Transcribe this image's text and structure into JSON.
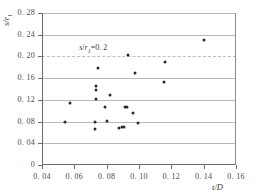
{
  "chart_data": {
    "type": "scatter",
    "title": "",
    "xlabel": "t/D",
    "ylabel": "s/r1",
    "xlim": [
      0.04,
      0.16
    ],
    "ylim": [
      0,
      0.28
    ],
    "xticks": [
      "0. 04",
      "0. 06",
      "0. 08",
      "0. 10",
      "0. 12",
      "0. 14",
      "0. 16"
    ],
    "xtick_values": [
      0.04,
      0.06,
      0.08,
      0.1,
      0.12,
      0.14,
      0.16
    ],
    "yticks": [
      "0",
      "0. 04",
      "0. 08",
      "0. 12",
      "0. 16",
      "0. 20",
      "0. 24",
      "0. 28"
    ],
    "ytick_values": [
      0,
      0.04,
      0.08,
      0.12,
      0.16,
      0.2,
      0.24,
      0.28
    ],
    "grid": true,
    "grid_axis": "y",
    "legend": "none",
    "annotations": [
      {
        "text_prefix": "s",
        "text_sep": "/",
        "text_var": "r",
        "text_sub": "1",
        "text_suffix": "=0. 2",
        "x": 0.063,
        "y": 0.216
      }
    ],
    "reference_line": {
      "y": 0.2,
      "style": "dashed",
      "label": "s/r1=0.2"
    },
    "marker": "filled-circle",
    "marker_color": "#2a2a2a",
    "points": [
      {
        "x": 0.0545,
        "y": 0.0795
      },
      {
        "x": 0.0572,
        "y": 0.1135
      },
      {
        "x": 0.0728,
        "y": 0.0655
      },
      {
        "x": 0.073,
        "y": 0.0795
      },
      {
        "x": 0.0732,
        "y": 0.1215
      },
      {
        "x": 0.0733,
        "y": 0.139
      },
      {
        "x": 0.0733,
        "y": 0.145
      },
      {
        "x": 0.0745,
        "y": 0.179
      },
      {
        "x": 0.0788,
        "y": 0.107
      },
      {
        "x": 0.08,
        "y": 0.0805
      },
      {
        "x": 0.0822,
        "y": 0.129
      },
      {
        "x": 0.0875,
        "y": 0.069
      },
      {
        "x": 0.0893,
        "y": 0.07
      },
      {
        "x": 0.0905,
        "y": 0.0705
      },
      {
        "x": 0.0915,
        "y": 0.106
      },
      {
        "x": 0.0925,
        "y": 0.1065
      },
      {
        "x": 0.093,
        "y": 0.2025
      },
      {
        "x": 0.0962,
        "y": 0.0955
      },
      {
        "x": 0.0975,
        "y": 0.1695
      },
      {
        "x": 0.0995,
        "y": 0.0775
      },
      {
        "x": 0.1155,
        "y": 0.153
      },
      {
        "x": 0.1162,
        "y": 0.1905
      },
      {
        "x": 0.1405,
        "y": 0.2305
      }
    ]
  }
}
